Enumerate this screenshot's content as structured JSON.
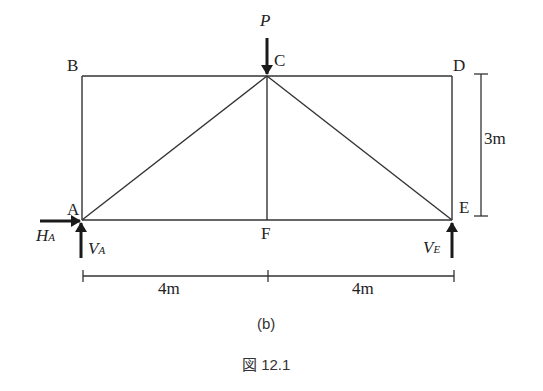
{
  "figure": {
    "subcaption": "(b)",
    "caption": "図 12.1"
  },
  "nodes": {
    "A": "A",
    "B": "B",
    "C": "C",
    "D": "D",
    "E": "E",
    "F": "F"
  },
  "loads": {
    "P": "P",
    "H_A_main": "H",
    "H_A_sub": "A",
    "V_A_main": "V",
    "V_A_sub": "A",
    "V_E_main": "V",
    "V_E_sub": "E"
  },
  "dimensions": {
    "height": "3m",
    "span_left": "4m",
    "span_right": "4m"
  },
  "colors": {
    "line": "#333333",
    "background": "#ffffff"
  }
}
